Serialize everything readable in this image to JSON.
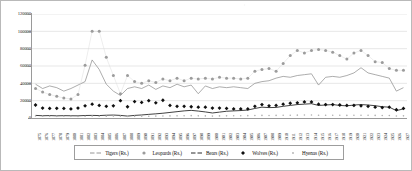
{
  "chart_data": {
    "type": "line",
    "title": "",
    "xlabel": "",
    "ylabel": "",
    "ylim": [
      0,
      120000
    ],
    "ytick_step": 20000,
    "yticks": [
      "0",
      "20000",
      "40000",
      "60000",
      "80000",
      "100000",
      "120000"
    ],
    "grid": true,
    "legend_position": "bottom",
    "categories": [
      "1875",
      "1876",
      "1877",
      "1878",
      "1879",
      "1880",
      "1881",
      "1882",
      "1883",
      "1884",
      "1885",
      "1886",
      "1887",
      "1888",
      "1889",
      "1890",
      "1891",
      "1892",
      "1893",
      "1894",
      "1895",
      "1896",
      "1897",
      "1898",
      "1899",
      "1900",
      "1901",
      "1902",
      "1903",
      "1904",
      "1905",
      "1906",
      "1907",
      "1908",
      "1909",
      "1910",
      "1911",
      "1912",
      "1913",
      "1914",
      "1915",
      "1916",
      "1917",
      "1918",
      "1919",
      "1920",
      "1921",
      "1922",
      "1923",
      "1924",
      "1925",
      "1926",
      "1927"
    ],
    "series": [
      {
        "name": "Tigers (Rs.)",
        "style": "line",
        "color": "#8a8a8a",
        "values": [
          39000,
          34000,
          37000,
          35000,
          31000,
          34000,
          38000,
          42000,
          67000,
          56000,
          39000,
          31000,
          26000,
          34000,
          36000,
          34000,
          38000,
          33000,
          37000,
          35000,
          39000,
          36000,
          38000,
          28000,
          37000,
          34000,
          36000,
          35000,
          36000,
          35000,
          34000,
          40000,
          42000,
          43000,
          46000,
          48000,
          47000,
          49000,
          50000,
          51000,
          38000,
          47000,
          48000,
          47000,
          49000,
          52000,
          58000,
          52000,
          50000,
          48000,
          46000,
          31000,
          35000
        ]
      },
      {
        "name": "Leopards (Rs.)",
        "style": "markers",
        "marker": "circle",
        "color": "#9c9c9c",
        "values": [
          34000,
          30000,
          27000,
          25000,
          23000,
          22000,
          27000,
          61000,
          100000,
          100000,
          70000,
          49000,
          28000,
          49000,
          42000,
          40000,
          43000,
          41000,
          45000,
          43000,
          46000,
          43000,
          46000,
          45000,
          46000,
          45000,
          47000,
          46000,
          46000,
          45000,
          46000,
          54000,
          56000,
          57000,
          54000,
          63000,
          72000,
          78000,
          75000,
          78000,
          79000,
          78000,
          76000,
          72000,
          68000,
          75000,
          78000,
          72000,
          65000,
          64000,
          57000,
          55000,
          55000
        ]
      },
      {
        "name": "Bears (Rs.)",
        "style": "line",
        "color": "#2b2b2b",
        "values": [
          3000,
          2600,
          2800,
          2500,
          2700,
          2600,
          2500,
          2900,
          3000,
          2800,
          3200,
          3400,
          3000,
          2200,
          3000,
          3500,
          4200,
          4800,
          5500,
          6400,
          7300,
          8200,
          8800,
          8000,
          7000,
          5800,
          6800,
          7800,
          8200,
          8600,
          9200,
          11000,
          12500,
          12000,
          12200,
          13500,
          14500,
          15500,
          16000,
          16500,
          14500,
          15000,
          15500,
          14500,
          14000,
          15000,
          15500,
          15000,
          14200,
          13000,
          12500,
          8500,
          10500
        ]
      },
      {
        "name": "Wolves (Rs.)",
        "style": "markers",
        "marker": "diamond",
        "color": "#101010",
        "values": [
          15000,
          11500,
          11000,
          11200,
          11000,
          10500,
          11500,
          14000,
          16000,
          14500,
          13500,
          14000,
          20000,
          13000,
          19000,
          18000,
          20000,
          17500,
          20500,
          14500,
          13500,
          13500,
          13000,
          12500,
          12500,
          11500,
          11500,
          11000,
          10500,
          10500,
          10500,
          13500,
          15500,
          14000,
          14500,
          16000,
          17000,
          17500,
          18500,
          18500,
          16000,
          15500,
          15500,
          15000,
          14500,
          14500,
          14000,
          13500,
          12500,
          12000,
          12500,
          9500,
          11000
        ]
      },
      {
        "name": "Hyenas (Rs.)",
        "style": "markers",
        "marker": "dot",
        "color": "#b0b0b0",
        "values": [
          2300,
          2100,
          2000,
          1900,
          2000,
          1900,
          1800,
          2100,
          2200,
          2000,
          2100,
          2200,
          2000,
          1700,
          1900,
          2000,
          2100,
          2200,
          2300,
          2400,
          2500,
          2600,
          2700,
          2500,
          2400,
          2200,
          2400,
          2500,
          2600,
          2600,
          2700,
          2900,
          3000,
          2900,
          3000,
          3100,
          3200,
          3300,
          3400,
          3400,
          3100,
          3200,
          3200,
          3100,
          3000,
          3100,
          3200,
          3100,
          3000,
          2900,
          2800,
          2300,
          2500
        ]
      }
    ]
  },
  "legend": {
    "items": [
      {
        "label": "Tigers (Rs.)",
        "key": "line-gray"
      },
      {
        "label": "Leopards (Rs.)",
        "key": "circle-gray"
      },
      {
        "label": "Bears (Rs.)",
        "key": "line-dark"
      },
      {
        "label": "Wolves (Rs.)",
        "key": "diamond-black"
      },
      {
        "label": "Hyenas (Rs.)",
        "key": "dot-light"
      }
    ]
  },
  "colors": {
    "grid": "#d6d6d6",
    "axis": "#9a9a9a",
    "border": "#b9b9b9",
    "tigers": "#8a8a8a",
    "leopards": "#9c9c9c",
    "bears": "#2b2b2b",
    "wolves": "#101010",
    "hyenas": "#b0b0b0"
  },
  "top_mark": "¬"
}
